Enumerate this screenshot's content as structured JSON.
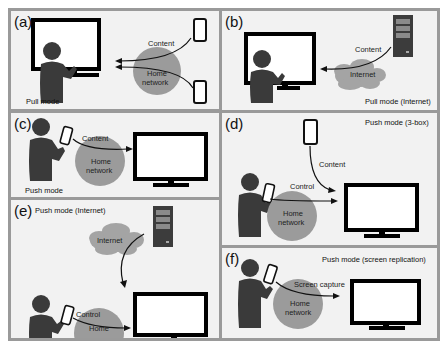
{
  "colors": {
    "frame": "#9a9a9a",
    "panel_bg": "#f2f2f2",
    "person": "#3a3a3a",
    "network_circle": "#9b9b9b",
    "cloud": "#a4a4a4",
    "server": "#3c3c3c",
    "server_slot": "#8a8a8a",
    "screen_border": "#000000",
    "screen_fill": "#ffffff"
  },
  "panels": {
    "a": {
      "label": "(a)",
      "caption": "Pull mode",
      "flow_label": "Content",
      "network_label": "Home\nnetwork",
      "network_l1": "Home",
      "network_l2": "network",
      "icons": [
        "person-icon",
        "display-icon",
        "smartphone-icon",
        "smartphone-icon",
        "home-network-icon"
      ]
    },
    "b": {
      "label": "(b)",
      "caption": "Pull mode (Internet)",
      "flow_label": "Content",
      "network_label": "Internet",
      "icons": [
        "person-icon",
        "display-icon",
        "server-icon",
        "cloud-icon"
      ]
    },
    "c": {
      "label": "(c)",
      "caption": "Push mode",
      "flow_label": "Content",
      "network_l1": "Home",
      "network_l2": "network",
      "icons": [
        "person-icon",
        "smartphone-icon",
        "display-icon",
        "home-network-icon"
      ]
    },
    "d": {
      "label": "(d)",
      "caption": "Push mode (3-box)",
      "flow_label_1": "Content",
      "flow_label_2": "Control",
      "network_l1": "Home",
      "network_l2": "network",
      "icons": [
        "person-icon",
        "smartphone-icon",
        "smartphone-icon",
        "display-icon",
        "home-network-icon"
      ]
    },
    "e": {
      "label": "(e)",
      "caption": "Push mode (Internet)",
      "cloud_label": "Internet",
      "flow_label": "Control",
      "network_l1": "Home",
      "network_l2": "network",
      "icons": [
        "person-icon",
        "smartphone-icon",
        "server-icon",
        "cloud-icon",
        "display-icon",
        "home-network-icon"
      ]
    },
    "f": {
      "label": "(f)",
      "caption": "Push mode (screen replication)",
      "flow_label": "Screen capture",
      "network_l1": "Home",
      "network_l2": "network",
      "icons": [
        "person-icon",
        "smartphone-icon",
        "display-icon",
        "home-network-icon"
      ]
    }
  }
}
